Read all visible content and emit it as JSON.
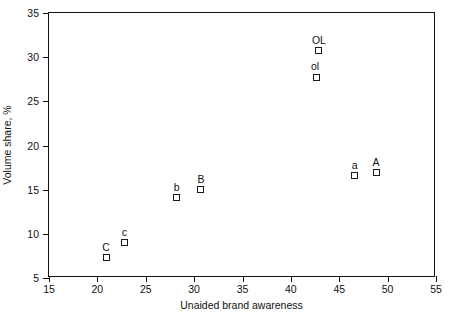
{
  "chart_data": {
    "type": "scatter",
    "title": "",
    "xlabel": "Unaided brand awareness",
    "ylabel": "Volume share, %",
    "xlim": [
      15,
      55
    ],
    "ylim": [
      5,
      35
    ],
    "xticks": [
      15,
      20,
      25,
      30,
      35,
      40,
      45,
      50,
      55
    ],
    "yticks": [
      5,
      10,
      15,
      20,
      25,
      30,
      35
    ],
    "grid": false,
    "legend": "none",
    "marker_style": "open-square",
    "point_color": "#1a1a1a",
    "points": [
      {
        "label": "OL",
        "x": 42.9,
        "y": 30.7,
        "label_dx": 0,
        "label_dy": -6
      },
      {
        "label": "ol",
        "x": 42.6,
        "y": 27.7,
        "label_dx": -1,
        "label_dy": -6
      },
      {
        "label": "A",
        "x": 48.8,
        "y": 16.9,
        "label_dx": 0,
        "label_dy": -6
      },
      {
        "label": "a",
        "x": 46.6,
        "y": 16.6,
        "label_dx": 0,
        "label_dy": -6
      },
      {
        "label": "B",
        "x": 30.7,
        "y": 15.0,
        "label_dx": 0,
        "label_dy": -6
      },
      {
        "label": "b",
        "x": 28.2,
        "y": 14.1,
        "label_dx": 0,
        "label_dy": -6
      },
      {
        "label": "c",
        "x": 22.8,
        "y": 9.0,
        "label_dx": 0,
        "label_dy": -6
      },
      {
        "label": "C",
        "x": 20.9,
        "y": 7.3,
        "label_dx": 0,
        "label_dy": -6
      }
    ]
  }
}
